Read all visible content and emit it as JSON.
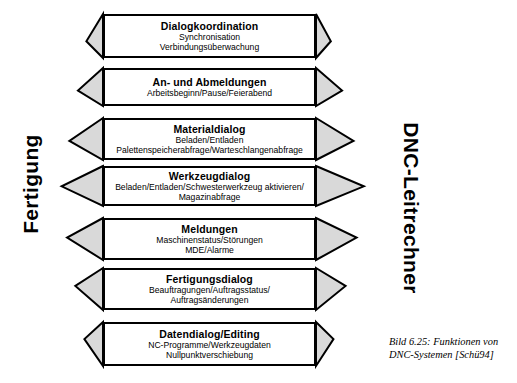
{
  "diagram": {
    "left_label": "Fertigung",
    "right_label": "DNC-Leitrechner",
    "caption": "Bild 6.25: Funktionen von DNC-Systemen [Schü94]",
    "colors": {
      "arrow_fill": "#d9d9d9",
      "box_fill": "#ffffff",
      "outline": "#000000",
      "text": "#000000"
    },
    "rows": [
      {
        "title": "Dialogkoordination",
        "lines": [
          "Synchronisation",
          "Verbindungsüberwachung"
        ]
      },
      {
        "title": "An- und Abmeldungen",
        "lines": [
          "Arbeitsbeginn/Pause/Feierabend"
        ]
      },
      {
        "title": "Materialdialog",
        "lines": [
          "Beladen/Entladen",
          "Palettenspeicherabfrage/Warteschlangenabfrage"
        ]
      },
      {
        "title": "Werkzeugdialog",
        "lines": [
          "Beladen/Entladen/Schwesterwerkzeug aktivieren/",
          "Magazinabfrage"
        ]
      },
      {
        "title": "Meldungen",
        "lines": [
          "Maschinenstatus/Störungen",
          "MDE/Alarme"
        ]
      },
      {
        "title": "Fertigungsdialog",
        "lines": [
          "Beauftragungen/Auftragsstatus/",
          "Auftragsänderungen"
        ]
      },
      {
        "title": "Datendialog/Editing",
        "lines": [
          "NC-Programme/Werkzeugdaten",
          "Nullpunktverschiebung"
        ]
      }
    ],
    "geometry": {
      "box_left": 103,
      "box_right": 316,
      "left_apex_x": 60,
      "right_apex_x": 366,
      "left_vanish_y": 196,
      "right_vanish_y": 196,
      "rows_y": [
        14,
        68,
        118,
        166,
        218,
        268,
        322
      ],
      "rows_h": [
        44,
        38,
        42,
        40,
        42,
        42,
        44
      ]
    }
  }
}
